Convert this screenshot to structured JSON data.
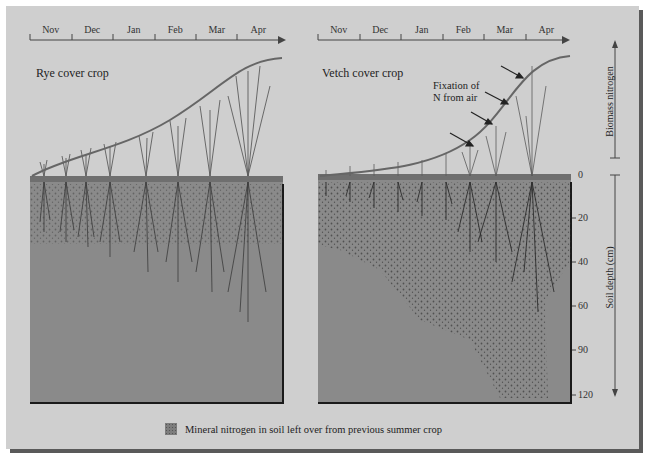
{
  "timeline": {
    "months": [
      "Nov",
      "Dec",
      "Jan",
      "Feb",
      "Mar",
      "Apr"
    ]
  },
  "panels": [
    {
      "title": "Rye cover crop"
    },
    {
      "title": "Vetch cover crop",
      "annotation_line1": "Fixation of",
      "annotation_line2": "N from air"
    }
  ],
  "axis_right": {
    "upper_label": "Biomass nitrogen",
    "upper_zero": "0",
    "lower_label": "Soil depth (cm)",
    "depth_ticks": [
      "20",
      "40",
      "60",
      "90",
      "120"
    ]
  },
  "legend": {
    "text": "Mineral nitrogen in soil left over from previous summer crop"
  },
  "colors": {
    "background": "#cfcfcf",
    "soil": "#8a8a8a",
    "curve": "#6a6a6a",
    "shadow": "#5a5a5a"
  }
}
